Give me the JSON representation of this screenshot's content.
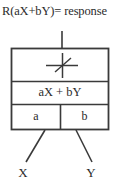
{
  "diagram": {
    "type": "block-diagram",
    "title": "R(aX+bY)= response",
    "output_label": "R(aX+bY)= response",
    "block": {
      "rows": [
        {
          "name": "nonlinearity",
          "label": "",
          "symbol": "static-nonlinearity-axes-with-slash"
        },
        {
          "name": "summation",
          "label": "aX + bY"
        },
        {
          "name": "gains",
          "cells": [
            {
              "label": "a"
            },
            {
              "label": "b"
            }
          ]
        }
      ]
    },
    "inputs": [
      {
        "name": "input-x",
        "label": "X"
      },
      {
        "name": "input-y",
        "label": "Y"
      }
    ],
    "colors": {
      "stroke": "#3a3a3a",
      "text": "#2b2b2b",
      "background": "#ffffff"
    }
  }
}
